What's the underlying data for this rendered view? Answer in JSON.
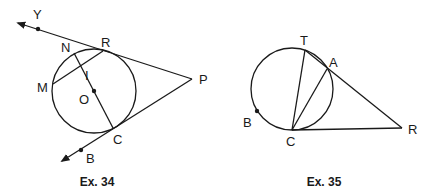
{
  "figures": [
    {
      "caption": "Ex. 34",
      "points": {
        "Y": "Y",
        "N": "N",
        "R": "R",
        "M": "M",
        "I": "I",
        "O": "O",
        "P": "P",
        "C": "C",
        "B": "B"
      },
      "description": "Circle with center O; tangent lines from external point P touch the circle at R and C; ray PR extends through Y, ray PC extends through B; chord MR and diameter NC intersect at I."
    },
    {
      "caption": "Ex. 35",
      "points": {
        "T": "T",
        "A": "A",
        "B": "B",
        "C": "C",
        "R": "R"
      },
      "description": "Circle with points T, A, B, C; secant R-A-T and tangent RC from external point R; chords CT and CA drawn; point B marked on the arc."
    }
  ],
  "colors": {
    "stroke": "#1a1a1a",
    "background": "#ffffff"
  }
}
